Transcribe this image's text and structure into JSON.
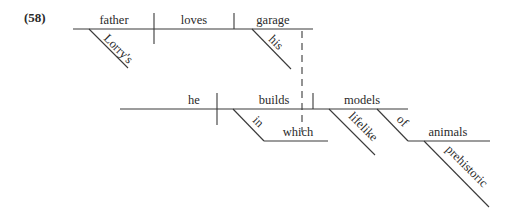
{
  "example_number": "(58)",
  "main_clause": {
    "subject": "father",
    "subject_modifier": "Lorry's",
    "verb": "loves",
    "object": "garage",
    "object_modifier": "his"
  },
  "relative_clause": {
    "subject": "he",
    "verb": "builds",
    "preposition": "in",
    "prep_object": "which",
    "object": "models",
    "object_modifier": "lifelike",
    "object_prep": "of",
    "object_prep_object": "animals",
    "object_prep_object_modifier": "prehistoric"
  },
  "colors": {
    "line": "#3a3a3a",
    "text": "#2a2a2a",
    "background": "#ffffff"
  }
}
